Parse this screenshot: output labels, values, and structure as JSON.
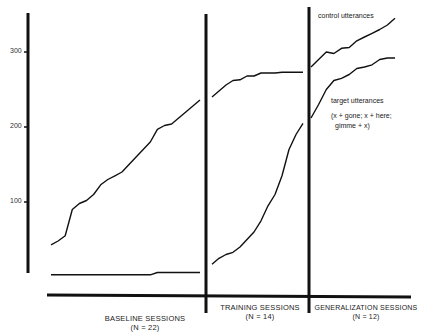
{
  "chart_data": {
    "type": "line",
    "title": "",
    "xlabel": "Sessions",
    "ylabel": "Cumulative utterances",
    "ylim": [
      0,
      350
    ],
    "yticks": [
      100,
      200,
      300
    ],
    "grid": false,
    "phases": [
      {
        "label": "BASELINE SESSIONS",
        "n_label": "(N = 22)",
        "sessions": 22
      },
      {
        "label": "TRAINING SESSIONS",
        "n_label": "(N = 14)",
        "sessions": 14
      },
      {
        "label": "GENERALIZATION SESSIONS",
        "n_label": "(N = 12)",
        "sessions": 12
      }
    ],
    "series": [
      {
        "name": "control utterances",
        "baseline": [
          43,
          48,
          55,
          90,
          98,
          102,
          110,
          123,
          130,
          135,
          140,
          150,
          160,
          170,
          180,
          197,
          202,
          204,
          212,
          220,
          228,
          236
        ],
        "training": [
          240,
          248,
          256,
          262,
          263,
          268,
          268,
          272,
          272,
          272,
          273,
          273,
          273,
          273
        ],
        "generalization": [
          280,
          290,
          300,
          298,
          305,
          306,
          315,
          320,
          325,
          330,
          336,
          345
        ]
      },
      {
        "name": "target utterances (x + gone; x + here; gimme + x)",
        "baseline": [
          3,
          3,
          3,
          3,
          3,
          3,
          3,
          3,
          3,
          3,
          3,
          3,
          3,
          3,
          3,
          6,
          6,
          6,
          6,
          6,
          6,
          6
        ],
        "training": [
          17,
          25,
          30,
          33,
          40,
          50,
          60,
          75,
          95,
          110,
          135,
          170,
          190,
          205
        ],
        "generalization": [
          212,
          230,
          250,
          262,
          265,
          270,
          278,
          280,
          283,
          290,
          292,
          292
        ]
      }
    ],
    "annotations": [
      "control utterances",
      "target utterances",
      "(x + gone; x + here;",
      "gimme + x)"
    ]
  },
  "axis": {
    "ticks": [
      {
        "label": "300",
        "value": 300
      },
      {
        "label": "200",
        "value": 200
      },
      {
        "label": "100",
        "value": 100
      }
    ]
  },
  "labels": {
    "control": "control utterances",
    "target": "target utterances",
    "target_detail_1": "(x + gone; x + here;",
    "target_detail_2": "gimme + x)",
    "baseline": "BASELINE SESSIONS",
    "baseline_n": "(N = 22)",
    "training": "TRAINING SESSIONS",
    "training_n": "(N = 14)",
    "generalization": "GENERALIZATION SESSIONS",
    "generalization_n": "(N = 12)"
  }
}
